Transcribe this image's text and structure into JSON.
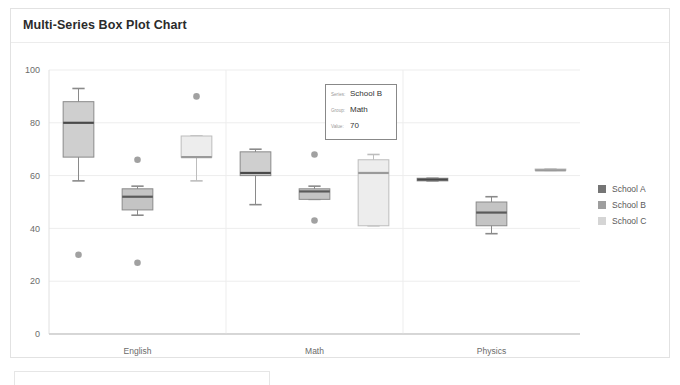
{
  "card": {
    "title": "Multi-Series Box Plot Chart"
  },
  "legend": {
    "position": "right",
    "items": [
      {
        "label": "School A",
        "color": "#757575"
      },
      {
        "label": "School B",
        "color": "#9e9e9e"
      },
      {
        "label": "School C",
        "color": "#d5d5d5"
      }
    ]
  },
  "tooltip": {
    "series_key": "Series:",
    "series_value": "School B",
    "group_key": "Group:",
    "group_value": "Math",
    "value_key": "Value:",
    "value_value": "70"
  },
  "chart_data": {
    "type": "box",
    "title": "Multi-Series Box Plot Chart",
    "xlabel": "",
    "ylabel": "",
    "categories": [
      "English",
      "Math",
      "Physics"
    ],
    "yticks": [
      0,
      20,
      40,
      60,
      80,
      100
    ],
    "ylim": [
      0,
      100
    ],
    "grid": true,
    "legend_position": "right",
    "series": [
      {
        "name": "School A",
        "color": "#cfcfcf",
        "border": "#8a8a8a",
        "median_color": "#4a4a4a",
        "boxes": [
          {
            "category": "English",
            "min": 58,
            "q1": 67,
            "median": 80,
            "q3": 88,
            "max": 93,
            "outliers": [
              30
            ]
          },
          {
            "category": "Math",
            "min": 49,
            "q1": 60,
            "median": 61,
            "q3": 69,
            "max": 70,
            "outliers": []
          },
          {
            "category": "Physics",
            "min": 58,
            "q1": 58,
            "median": 58.5,
            "q3": 59,
            "max": 59,
            "outliers": []
          }
        ]
      },
      {
        "name": "School B",
        "color": "#c4c4c4",
        "border": "#8a8a8a",
        "median_color": "#5a5a5a",
        "boxes": [
          {
            "category": "English",
            "min": 45,
            "q1": 47,
            "median": 52,
            "q3": 55,
            "max": 56,
            "outliers": [
              66,
              27
            ]
          },
          {
            "category": "Math",
            "min": 51,
            "q1": 51,
            "median": 54,
            "q3": 55,
            "max": 56,
            "outliers": [
              68,
              43
            ]
          },
          {
            "category": "Physics",
            "min": 38,
            "q1": 41,
            "median": 46,
            "q3": 50,
            "max": 52,
            "outliers": []
          }
        ]
      },
      {
        "name": "School C",
        "color": "#ededed",
        "border": "#bdbdbd",
        "median_color": "#9a9a9a",
        "boxes": [
          {
            "category": "English",
            "min": 58,
            "q1": 67,
            "median": 67,
            "q3": 75,
            "max": 75,
            "outliers": [
              90
            ]
          },
          {
            "category": "Math",
            "min": 41,
            "q1": 41,
            "median": 61,
            "q3": 66,
            "max": 68,
            "outliers": []
          },
          {
            "category": "Physics",
            "min": 62,
            "q1": 62,
            "median": 62,
            "q3": 62.5,
            "max": 62.5,
            "outliers": []
          }
        ]
      }
    ],
    "outlier_color": "#8c8c8c"
  }
}
